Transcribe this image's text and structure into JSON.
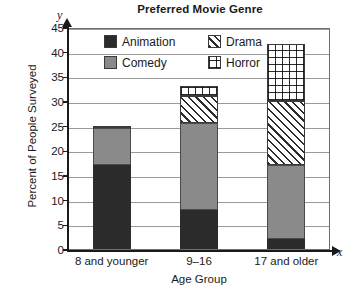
{
  "chart_data": {
    "type": "bar",
    "subtype": "stacked",
    "title": "Preferred Movie Genre",
    "xlabel": "Age Group",
    "ylabel": "Percent of People Surveyed",
    "x_axis_letter": "x",
    "y_axis_letter": "y",
    "categories": [
      "8 and younger",
      "9–16",
      "17 and older"
    ],
    "ylim": [
      0,
      45
    ],
    "ytick_labels": [
      "0",
      "5",
      "10",
      "15",
      "20",
      "25",
      "30",
      "35",
      "40",
      "45"
    ],
    "ytick_values": [
      0,
      5,
      10,
      15,
      20,
      25,
      30,
      35,
      40,
      45
    ],
    "grid": true,
    "legend_position": "inside-top-center",
    "series": [
      {
        "name": "Animation",
        "fill": "solid-black",
        "color": "#2b2b2b",
        "values": [
          17,
          8,
          2
        ]
      },
      {
        "name": "Comedy",
        "fill": "solid-gray",
        "color": "#8a8a8a",
        "values": [
          7.5,
          17.5,
          15
        ]
      },
      {
        "name": "Drama",
        "fill": "diagonal-hatch",
        "color": "#ffffff",
        "values": [
          0.5,
          5.5,
          13
        ]
      },
      {
        "name": "Horror",
        "fill": "grid-hatch",
        "color": "#ffffff",
        "values": [
          0,
          2,
          11.5
        ]
      }
    ],
    "totals": [
      25,
      33,
      41.5
    ]
  },
  "legend": {
    "entries": [
      {
        "label": "Animation"
      },
      {
        "label": "Drama"
      },
      {
        "label": "Comedy"
      },
      {
        "label": "Horror"
      }
    ]
  }
}
